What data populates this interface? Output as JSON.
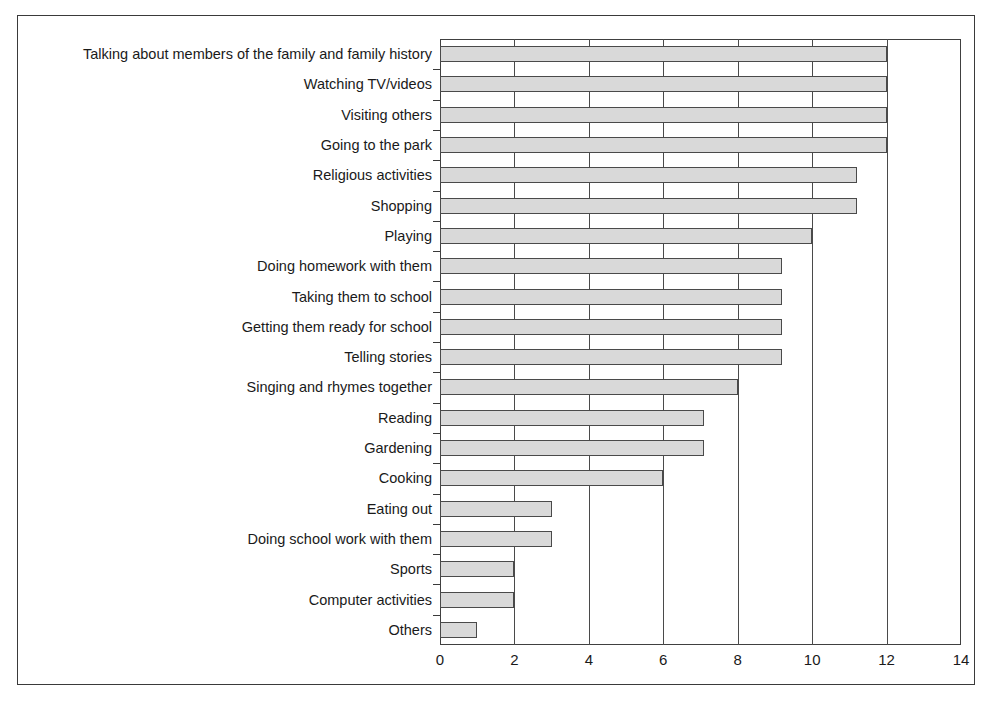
{
  "chart_data": {
    "type": "bar",
    "orientation": "horizontal",
    "title": "",
    "subtitle": "",
    "xlabel": "",
    "ylabel": "",
    "xlim": [
      0,
      14
    ],
    "xticks": [
      0,
      2,
      4,
      6,
      8,
      10,
      12,
      14
    ],
    "xtick_labels": [
      "0",
      "2",
      "4",
      "6",
      "8",
      "10",
      "12",
      "14"
    ],
    "grid": true,
    "grid_axis": "x",
    "legend": false,
    "legend_position": "none",
    "bar_fill_color": "#d9d9d9",
    "bar_border_color": "#4a4a4a",
    "axis_color": "#404040",
    "categories": [
      "Talking about members of the family and family history",
      "Watching TV/videos",
      "Visiting others",
      "Going to the park",
      "Religious activities",
      "Shopping",
      "Playing",
      "Doing homework with them",
      "Taking them to school",
      "Getting them ready for school",
      "Telling stories",
      "Singing and rhymes together",
      "Reading",
      "Gardening",
      "Cooking",
      "Eating out",
      "Doing school work with them",
      "Sports",
      "Computer activities",
      "Others"
    ],
    "values": [
      12,
      12,
      12,
      12,
      11.2,
      11.2,
      10,
      9.2,
      9.2,
      9.2,
      9.2,
      8,
      7.1,
      7.1,
      6,
      3,
      3,
      2,
      2,
      1
    ]
  }
}
